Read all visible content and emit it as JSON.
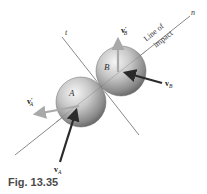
{
  "figure": {
    "caption": "Fig. 13.35",
    "axes": {
      "normal_label": "n",
      "tangent_label": "t",
      "line_of_impact_line1": "Line of",
      "line_of_impact_line2": "impact"
    },
    "bodies": {
      "sphere_a_label": "A",
      "sphere_b_label": "B"
    },
    "vectors": {
      "v_a": {
        "symbol": "v",
        "subscript": "A",
        "prime": ""
      },
      "v_a_prime": {
        "symbol": "v",
        "subscript": "A",
        "prime": "′"
      },
      "v_b": {
        "symbol": "v",
        "subscript": "B",
        "prime": ""
      },
      "v_b_prime": {
        "symbol": "v",
        "subscript": "B",
        "prime": "′"
      }
    },
    "colors": {
      "line": "#6b6b6b",
      "initial_velocity": "#2a2a2a",
      "final_velocity": "#a9a9a9",
      "sphere_light": "#f2f2f2",
      "sphere_dark": "#6e6e6e",
      "caption": "#4a4a4a"
    }
  }
}
